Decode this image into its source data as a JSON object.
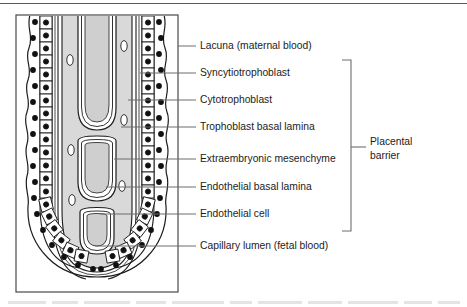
{
  "figure": {
    "type": "anatomical-diagram",
    "top_rule": true,
    "frame": {
      "x": 16,
      "y": 15,
      "width": 162,
      "height": 277
    },
    "colors": {
      "ink": "#1c1c1c",
      "leader": "#6d6d6d",
      "fill_light": "#d9d9d9",
      "fill_mid": "#c9c9c9",
      "fill_white": "#ffffff",
      "caption": "#9a9a9a",
      "rule": "#5a5a5a"
    }
  },
  "labels": [
    {
      "id": "lacuna",
      "text": "Lacuna (maternal blood)",
      "y": 46,
      "leader_x1": 178,
      "leader_x2": 196,
      "in_barrier": false
    },
    {
      "id": "syncytio",
      "text": "Syncytiotrophoblast",
      "y": 73,
      "leader_x1": 140,
      "leader_x2": 196,
      "in_barrier": true
    },
    {
      "id": "cyto",
      "text": "Cytotrophoblast",
      "y": 100,
      "leader_x1": 128,
      "leader_x2": 196,
      "in_barrier": true
    },
    {
      "id": "troph-basal",
      "text": "Trophoblast basal lamina",
      "y": 127,
      "leader_x1": 121,
      "leader_x2": 196,
      "in_barrier": true
    },
    {
      "id": "mesenchyme",
      "text": "Extraembryonic mesenchyme",
      "y": 159,
      "leader_x1": 114,
      "leader_x2": 196,
      "in_barrier": true
    },
    {
      "id": "endo-basal",
      "text": "Endothelial basal lamina",
      "y": 187,
      "leader_x1": 106,
      "leader_x2": 196,
      "in_barrier": true
    },
    {
      "id": "endo-cell",
      "text": "Endothelial cell",
      "y": 214,
      "leader_x1": 100,
      "leader_x2": 196,
      "in_barrier": true
    },
    {
      "id": "capillary",
      "text": "Capillary lumen (fetal blood)",
      "y": 246,
      "leader_x1": 95,
      "leader_x2": 196,
      "in_barrier": false
    }
  ],
  "bracket": {
    "label_line1": "Placental",
    "label_line2": "barrier",
    "x": 351,
    "y_top": 60,
    "y_bottom": 231,
    "tick_y": 147,
    "text_x": 378
  },
  "caption": {
    "text": "",
    "visible": false
  }
}
